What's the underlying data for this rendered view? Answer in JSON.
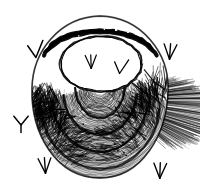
{
  "canvas": {
    "width": 200,
    "height": 191,
    "background_color": "#ffffff",
    "ink_color": "#000000",
    "title": "Pen-and-ink shell illustration"
  },
  "artwork": {
    "subject_label": "bivalve shell",
    "style_label": "pen and ink cross-hatching",
    "caption": ""
  },
  "shell": {
    "name_label": "clam shell",
    "outline": {
      "cx": 100,
      "cy": 98,
      "rx": 68,
      "ry": 82,
      "top_y": 16,
      "bottom_y": 178
    },
    "aperture": {
      "label": "shell opening",
      "cx": 101,
      "cy": 64,
      "rx": 40,
      "ry": 27,
      "fill_color": "#ffffff"
    },
    "rim_bands": [
      {
        "label": "rim band 1",
        "offset": 0
      },
      {
        "label": "rim band 2",
        "offset": 7
      },
      {
        "label": "rim band 3",
        "offset": 14
      }
    ],
    "growth_rings": [
      {
        "label": "growth ring 1",
        "ry": 36
      },
      {
        "label": "growth ring 2",
        "ry": 48
      },
      {
        "label": "growth ring 3",
        "ry": 60
      },
      {
        "label": "growth ring 4",
        "ry": 72
      }
    ],
    "shadow": {
      "label": "hatched cast shadow",
      "side": "lower-right"
    }
  },
  "bird_marks": [
    {
      "id": "mark-upper-left",
      "label": "bird mark upper left",
      "glyph": "check",
      "x": 36,
      "y": 50,
      "size": 17,
      "rotate": -6
    },
    {
      "id": "mark-upper-right",
      "label": "bird mark upper right",
      "glyph": "trident",
      "x": 170,
      "y": 52,
      "size": 16,
      "rotate": 4
    },
    {
      "id": "mark-aperture-left",
      "label": "bird mark in opening left",
      "glyph": "trident",
      "x": 91,
      "y": 62,
      "size": 14,
      "rotate": -2
    },
    {
      "id": "mark-aperture-right",
      "label": "bird mark in opening right",
      "glyph": "check",
      "x": 121,
      "y": 67,
      "size": 15,
      "rotate": 6
    },
    {
      "id": "mark-lower-left",
      "label": "bird mark lower left",
      "glyph": "wye",
      "x": 21,
      "y": 124,
      "size": 17,
      "rotate": 0
    },
    {
      "id": "mark-bottom-left",
      "label": "bird mark bottom left",
      "glyph": "trident",
      "x": 45,
      "y": 166,
      "size": 16,
      "rotate": -4
    },
    {
      "id": "mark-bottom-right",
      "label": "bird mark bottom right",
      "glyph": "trident",
      "x": 160,
      "y": 171,
      "size": 16,
      "rotate": 2
    }
  ]
}
